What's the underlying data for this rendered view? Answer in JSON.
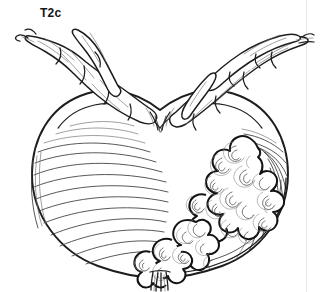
{
  "figure": {
    "stage_label": "T2c",
    "style": "black and white medical line drawing",
    "background_color": "#ffffff",
    "ink_color": "#1d1d1d",
    "shading_color": "#707070",
    "plate_border_color": "#e6e6e6"
  },
  "anatomy": {
    "organ": "urinary bladder",
    "parts": [
      {
        "name": "bladder-body",
        "description": "large rounded heart-shaped bladder body with curved muscle striations"
      },
      {
        "name": "bladder-dome",
        "description": "upper dome with central notch where vessels converge"
      },
      {
        "name": "vessel-bundle-left",
        "description": "lobulated tubular vessel bundle ascending to upper left"
      },
      {
        "name": "vessel-bundle-right",
        "description": "lobulated tubular vessel bundle ascending to upper right"
      },
      {
        "name": "tumor-mass",
        "description": "lobulated papillary tumor invading the right inferior bladder wall"
      },
      {
        "name": "urethra-stalk",
        "description": "short paired urethral stalk at the inferior pole"
      }
    ]
  }
}
